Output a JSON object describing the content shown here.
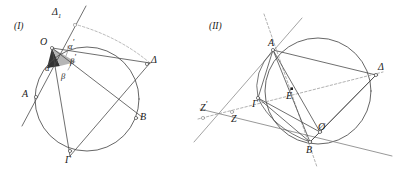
{
  "figure": {
    "caption_i": "(I)",
    "caption_ii": "(II)",
    "background": "#ffffff",
    "stroke": "#4a4a4a",
    "ink": "#1a1a1a",
    "fill_dark": "#333333",
    "fill_light": "#b5b5b5"
  },
  "panel_i": {
    "id": "(I)",
    "labels": {
      "delta1_base": "Δ",
      "delta1_sub": "1",
      "center": "O",
      "alpha_prime_base": "α",
      "alpha_prime_mark": "'",
      "beta_prime_base": "β",
      "beta_prime_mark": "'",
      "alpha": "α",
      "beta": "β",
      "point_a": "A",
      "point_b": "B",
      "point_gamma": "Γ",
      "point_delta": "Δ"
    },
    "points": {
      "O": [
        52,
        48
      ],
      "A": [
        25,
        98
      ],
      "B": [
        142,
        117
      ],
      "G": [
        70,
        156
      ],
      "D": [
        150,
        63
      ],
      "D1": [
        70,
        22
      ]
    },
    "circle": {
      "cx": 87,
      "cy": 99,
      "r": 52
    },
    "angles": {
      "alpha_value_note": "α",
      "beta_value_note": "β",
      "alpha_prime_note": "α'",
      "beta_prime_note": "β'"
    }
  },
  "panel_ii": {
    "id": "(II)",
    "labels": {
      "point_a": "A",
      "point_b": "B",
      "point_gamma": "Γ",
      "point_delta": "Δ",
      "point_e": "E",
      "point_o": "Ø",
      "point_z": "Z",
      "point_z_prime_base": "Z",
      "point_z_prime_mark": "'"
    },
    "points": {
      "A": [
        273,
        50
      ],
      "B": [
        310,
        142
      ],
      "G": [
        258,
        98
      ],
      "D": [
        376,
        75
      ],
      "E": [
        292,
        94
      ],
      "O": [
        320,
        132
      ],
      "Z": [
        232,
        112
      ],
      "Zp": [
        205,
        117
      ]
    },
    "circle": {
      "cx": 318,
      "cy": 91,
      "r": 53
    }
  }
}
